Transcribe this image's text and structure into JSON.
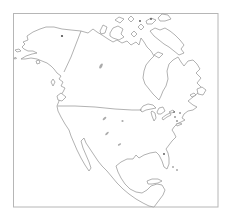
{
  "window": {
    "background_color": "#ffffff"
  },
  "map": {
    "description": "Unlabeled outline map of North America (Alaska, Canada, United States, Mexico, Central America, Caribbean) inside a thin rectangular frame; no text labels",
    "canvas": {
      "width": 233,
      "height": 223
    },
    "frame": {
      "x": 13.5,
      "y": 13.5,
      "width": 204.5,
      "height": 193.5,
      "stroke": "#b6b6b6",
      "stroke_width": 1
    },
    "style": {
      "coast_stroke": "#909090",
      "coast_width": 0.7,
      "land_fill": "#ffffff",
      "lake_fill": "#9b9b9b",
      "marker_fill": "#4f4f4f"
    },
    "features": [
      {
        "name": "mainland-north-america",
        "d": "M22,47 L25,44 L23,42 L28,40 L27,36 L33,32 L40,29 L46,27 L54,27 L62,29 L71,30 L81,31 L88,33 L93,29 L97,32 L102,35 L108,39 L113,42 L117,40 L122,43 L127,41 L131,45 L136,42 L139,45 L141,38 L144,42 L147,47 L151,51 L154,56 L150,60 L146,65 L144,71 L143,78 L145,84 L149,89 L153,94 L157,98 L159,100 L161,96 L163,91 L166,86 L168,79 L167,71 L169,64 L173,60 L178,57 L181,62 L184,66 L188,61 L193,60 L197,64 L200,69 L196,73 L201,78 L197,83 L202,88 L198,93 L193,97 L188,101 L193,105 L197,107 L193,110 L188,111 L184,114 L182,118 L185,120 L181,122 L177,124 L174,127 L172,130 L174,133 L176,137 L172,141 L169,145 L166,149 L168,153 L169,158 L169,164 L167,169 L164,167 L162,161 L159,155 L156,152 L150,153 L144,155 L139,158 L136,155 L133,159 L127,159 L121,162 L116,166 L118,172 L121,178 L125,184 L130,189 L136,192 L142,193 L147,190 L151,186 L157,184 L162,185 L165,190 L163,195 L160,199 L157,203 L154,207 L149,206 L143,203 L136,199 L129,194 L123,189 L117,183 L112,177 L107,171 L102,166 L98,161 L94,155 L90,149 L86,143 L84,138 L81,141 L83,148 L86,155 L89,162 L91,168 L89,171 L85,165 L81,158 L77,150 L74,143 L71,136 L69,130 L65,124 L61,117 L58,111 L57,106 L59,101 L60,96 L63,92 L65,88 L61,86 L63,82 L59,79 L61,76 L57,73 L54,69 L51,66 L47,63 L42,61 L37,59 L31,58 L25,59 L21,59 L26,56 L32,54 L37,53 L33,51 L28,51 L24,49 Z"
      },
      {
        "name": "island-banks",
        "d": "M100,31 L103,25 L107,27 L105,33 L101,34 Z"
      },
      {
        "name": "island-victoria",
        "d": "M110,33 L113,28 L118,26 L123,29 L121,34 L124,37 L119,40 L113,38 L110,36 Z"
      },
      {
        "name": "island-king-william",
        "d": "M131,34 L134,31 L137,34 L134,37 Z"
      },
      {
        "name": "island-somerset",
        "d": "M138,27 L141,24 L144,27 L141,30 Z"
      },
      {
        "name": "island-melville",
        "d": "M115,20 L119,17 L124,19 L120,23 Z"
      },
      {
        "name": "island-bathurst",
        "d": "M128,19 L131,16 L134,19 L131,22 Z"
      },
      {
        "name": "island-devon",
        "d": "M146,21 L151,18 L156,20 L152,24 L147,24 Z"
      },
      {
        "name": "island-ellesmere",
        "d": "M158,18 L162,14 L168,15 L171,19 L165,21 L160,21 Z"
      },
      {
        "name": "island-baffin",
        "d": "M150,31 L155,28 L160,30 L165,28 L170,31 L175,35 L180,40 L184,45 L181,49 L184,53 L179,55 L174,51 L169,47 L164,44 L159,40 L154,36 Z"
      },
      {
        "name": "island-southampton",
        "d": "M154,55 L158,52 L163,54 L159,58 Z"
      },
      {
        "name": "island-newfoundland",
        "d": "M197,89 L202,87 L206,90 L203,95 L198,94 Z"
      },
      {
        "name": "island-anticosti",
        "d": "M190,95 L194,93 L196,95 L192,97 Z"
      },
      {
        "name": "island-vancouver",
        "d": "M57,96 L61,93 L66,97 L62,101 L58,100 Z"
      },
      {
        "name": "island-haida-gwaii",
        "d": "M51,82 L53,79 L55,82 L53,86 Z"
      },
      {
        "name": "island-kodiak",
        "d": "M36,61 L39,60 L40,63 L37,64 Z"
      },
      {
        "name": "island-st-lawrence",
        "d": "M15,50 L19,49 L21,51 L17,52 Z"
      },
      {
        "name": "island-aleutian-islet",
        "d": "M14,58 L16,57.5 L16.5,58.5 L14.5,59 Z"
      },
      {
        "name": "island-cuba",
        "d": "M147,181 L152,179 L158,179 L162,181 L158,183 L152,184 L148,184 Z"
      },
      {
        "name": "island-long-island",
        "d": "M176,124 L180,123 L182,124 L177,126 Z"
      },
      {
        "name": "lake-superior",
        "d": "M140,110 L143,106 L148,104 L153,105 L156,108 L151,109 L146,110 L142,112 Z"
      },
      {
        "name": "lake-michigan",
        "d": "M152,111 L155,113 L156,118 L154,121 L152,116 L151,112 Z"
      },
      {
        "name": "lake-huron",
        "d": "M157,112 L159,108 L163,107 L165,111 L161,114 L158,114 Z"
      },
      {
        "name": "lake-erie",
        "d": "M162,118 L166,115 L170,113 L171,115 L167,117 L163,120 Z"
      },
      {
        "name": "lake-ontario",
        "d": "M169,112 L173,110 L175,112 L171,113 Z"
      }
    ],
    "borders": [
      {
        "name": "border-usa-canada",
        "d": "M57.5,106 L75,106 L95,107 L115,109 L132,110 L142,110"
      },
      {
        "name": "border-alaska-canada",
        "d": "M81,31 L76,44 L71,57 L64,72"
      }
    ],
    "lakes": [
      {
        "name": "lake-smudge-great-bear",
        "cx": 101,
        "cy": 66,
        "rx": 2.8,
        "ry": 1.3,
        "rotate": -60
      },
      {
        "name": "lake-smudge-plains-1",
        "cx": 104.5,
        "cy": 118.5,
        "rx": 2.2,
        "ry": 1.0,
        "rotate": -40
      },
      {
        "name": "lake-smudge-plains-2",
        "cx": 122.5,
        "cy": 121,
        "rx": 1.1,
        "ry": 1.0,
        "rotate": 0
      },
      {
        "name": "lake-smudge-plains-3",
        "cx": 107,
        "cy": 133.5,
        "rx": 2.2,
        "ry": 0.9,
        "rotate": -40
      },
      {
        "name": "lake-smudge-plains-4",
        "cx": 119.5,
        "cy": 144.5,
        "rx": 1.8,
        "ry": 0.9,
        "rotate": -30
      }
    ],
    "markers": [
      {
        "name": "dot-alaska",
        "cx": 62,
        "cy": 36,
        "r": 1.1
      },
      {
        "name": "dot-arctic-1",
        "cx": 140,
        "cy": 21,
        "r": 0.9
      },
      {
        "name": "dot-arctic-2",
        "cx": 151,
        "cy": 19,
        "r": 0.9
      },
      {
        "name": "dot-northeast-1",
        "cx": 174,
        "cy": 112,
        "r": 0.8
      },
      {
        "name": "dot-northeast-2",
        "cx": 180,
        "cy": 113,
        "r": 0.8
      },
      {
        "name": "dot-northeast-3",
        "cx": 175,
        "cy": 117,
        "r": 0.8
      },
      {
        "name": "dot-northeast-4",
        "cx": 177,
        "cy": 121,
        "r": 0.8
      },
      {
        "name": "dot-florida",
        "cx": 164,
        "cy": 154,
        "r": 0.9
      },
      {
        "name": "dot-bahamas-1",
        "cx": 173,
        "cy": 167,
        "r": 0.7
      },
      {
        "name": "dot-bahamas-2",
        "cx": 177,
        "cy": 170,
        "r": 0.7
      }
    ]
  }
}
